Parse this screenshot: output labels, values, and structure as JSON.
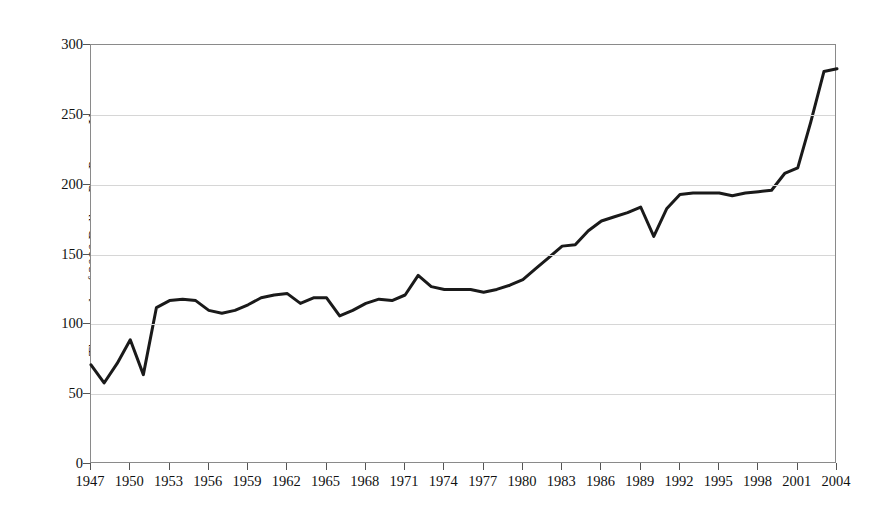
{
  "chart_data": {
    "type": "line",
    "title": "",
    "xlabel": "",
    "ylabel": "Thousands of 2000 Dollars Per Person-Year",
    "ylim": [
      0,
      300
    ],
    "xlim": [
      1947,
      2004
    ],
    "yticks": [
      0,
      50,
      100,
      150,
      200,
      250,
      300
    ],
    "xticks": [
      1947,
      1950,
      1953,
      1956,
      1959,
      1962,
      1965,
      1968,
      1971,
      1974,
      1977,
      1980,
      1983,
      1986,
      1989,
      1992,
      1995,
      1998,
      2001,
      2004
    ],
    "grid": true,
    "legend": null,
    "line_color": "#1a1a1a",
    "line_width": 3,
    "x": [
      1947,
      1948,
      1949,
      1950,
      1951,
      1952,
      1953,
      1954,
      1955,
      1956,
      1957,
      1958,
      1959,
      1960,
      1961,
      1962,
      1963,
      1964,
      1965,
      1966,
      1967,
      1968,
      1969,
      1970,
      1971,
      1972,
      1973,
      1974,
      1975,
      1976,
      1977,
      1978,
      1979,
      1980,
      1981,
      1982,
      1983,
      1984,
      1985,
      1986,
      1987,
      1988,
      1989,
      1990,
      1991,
      1992,
      1993,
      1994,
      1995,
      1996,
      1997,
      1998,
      1999,
      2000,
      2001,
      2002,
      2003,
      2004
    ],
    "y": [
      71,
      58,
      72,
      89,
      64,
      112,
      117,
      118,
      117,
      110,
      108,
      110,
      114,
      119,
      121,
      122,
      115,
      119,
      119,
      106,
      110,
      115,
      118,
      117,
      121,
      135,
      127,
      125,
      125,
      125,
      123,
      125,
      128,
      132,
      140,
      148,
      156,
      157,
      167,
      174,
      177,
      180,
      184,
      163,
      183,
      193,
      194,
      194,
      194,
      192,
      194,
      195,
      196,
      208,
      212,
      245,
      281,
      283
    ],
    "series": [
      {
        "name": "Thousands of 2000 Dollars Per Person-Year",
        "values": [
          71,
          58,
          72,
          89,
          64,
          112,
          117,
          118,
          117,
          110,
          108,
          110,
          114,
          119,
          121,
          122,
          115,
          119,
          119,
          106,
          110,
          115,
          118,
          117,
          121,
          135,
          127,
          125,
          125,
          125,
          123,
          125,
          128,
          132,
          140,
          148,
          156,
          157,
          167,
          174,
          177,
          180,
          184,
          163,
          183,
          193,
          194,
          194,
          194,
          192,
          194,
          195,
          196,
          208,
          212,
          245,
          281,
          283
        ]
      }
    ]
  }
}
